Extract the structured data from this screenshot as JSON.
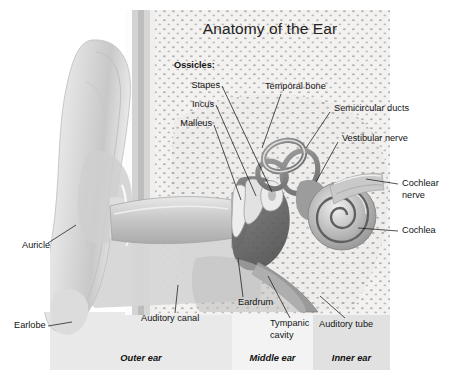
{
  "figure": {
    "title": "Anatomy of the Ear",
    "background_color": "#ffffff",
    "panel_colors": {
      "outer": "#e9e9e9",
      "middle": "#f2f2f2",
      "inner": "#e2e2e2",
      "bone": "#f4f3f1",
      "tissue": "#d9d9d9",
      "dark": "#6e6e6e"
    }
  },
  "labels": {
    "ossicles_heading": "Ossicles:",
    "stapes": "Stapes",
    "incus": "Incus",
    "malleus": "Malleus",
    "temporal_bone": "Temporal bone",
    "semicircular_ducts": "Semicircular ducts",
    "vestibular_nerve": "Vestibular nerve",
    "cochlear_nerve": "Cochlear\nnerve",
    "cochlea": "Cochlea",
    "auricle": "Auricle",
    "earlobe": "Earlobe",
    "auditory_canal": "Auditory canal",
    "eardrum": "Eardrum",
    "tympanic_cavity": "Tympanic\ncavity",
    "auditory_tube": "Auditory tube"
  },
  "regions": {
    "outer_ear": "Outer ear",
    "middle_ear": "Middle ear",
    "inner_ear": "Inner ear"
  }
}
